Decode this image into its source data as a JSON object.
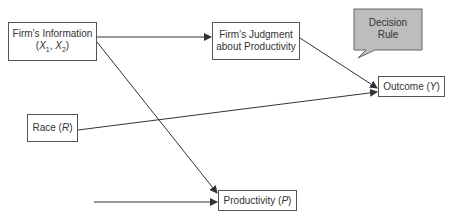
{
  "diagram": {
    "type": "causal-path-diagram",
    "nodes": {
      "firm_info": {
        "line1": "Firm’s Information",
        "line2_open": "(",
        "x1": "X",
        "x1_sub": "1",
        "sep": ", ",
        "x2": "X",
        "x2_sub": "2",
        "line2_close": ")"
      },
      "firm_judgment": {
        "line1": "Firm’s Judgment",
        "line2": "about Productivity"
      },
      "outcome": {
        "label": "Outcome (",
        "var": "Y",
        "close": ")"
      },
      "race": {
        "label": "Race (",
        "var": "R",
        "close": ")"
      },
      "productivity": {
        "label": "Productivity (",
        "var": "P",
        "close": ")"
      }
    },
    "callout": {
      "line1": "Decision",
      "line2": "Rule",
      "fill": "#bdbdbd"
    },
    "edges": [
      {
        "from": "firm_info",
        "to": "firm_judgment"
      },
      {
        "from": "firm_info",
        "to": "productivity"
      },
      {
        "from": "firm_judgment",
        "to": "outcome"
      },
      {
        "from": "race",
        "to": "outcome"
      },
      {
        "from": "unlabeled_source",
        "to": "productivity"
      }
    ],
    "colors": {
      "line": "#333333",
      "border": "#555555",
      "text": "#333333"
    }
  }
}
